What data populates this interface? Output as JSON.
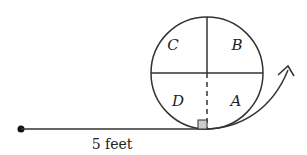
{
  "diagram": {
    "regions": {
      "a": "A",
      "b": "B",
      "c": "C",
      "d": "D"
    },
    "distance_label": "5 feet",
    "colors": {
      "stroke": "#333333",
      "right_angle_fill": "#cccccc"
    }
  }
}
